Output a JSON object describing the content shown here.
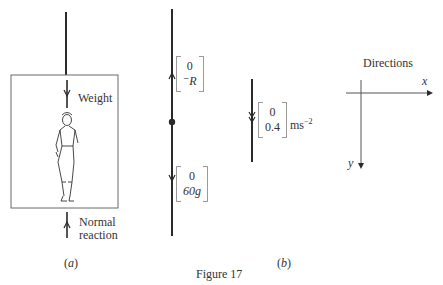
{
  "figure": {
    "caption": "Figure 17",
    "part_a_label": "(a)",
    "part_b_label": "(b)"
  },
  "panel_a": {
    "force_top_label": "Weight",
    "force_bottom_label_line1": "Normal",
    "force_bottom_label_line2": "reaction"
  },
  "panel_b": {
    "upper_vector": {
      "top": "0",
      "bottom": "⁻R"
    },
    "lower_vector": {
      "top": "0",
      "bottom": "60g"
    }
  },
  "acceleration": {
    "vector": {
      "top": "0",
      "bottom": "0.4"
    },
    "unit": "ms",
    "unit_exponent": "−2"
  },
  "directions": {
    "title": "Directions",
    "x_label": "x",
    "y_label": "y"
  },
  "colors": {
    "line": "#2a2a2a",
    "box": "#6a6a6a",
    "bracket": "#9a9a9a"
  }
}
